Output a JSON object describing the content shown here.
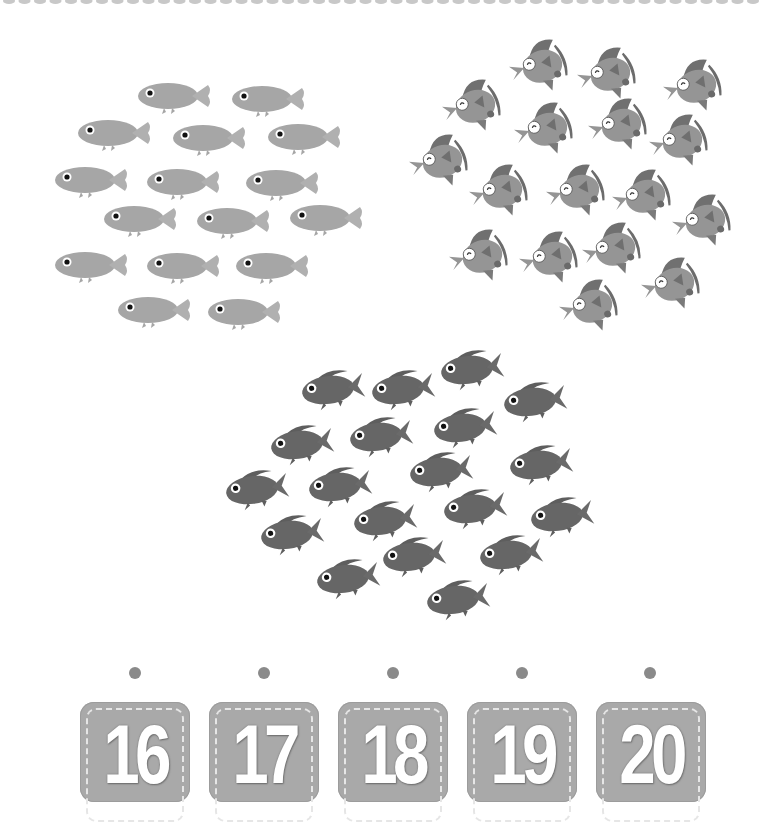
{
  "worksheet": {
    "task": "count-and-match",
    "groups": [
      {
        "name": "light-fish-group",
        "species": "plain fish",
        "count": 16,
        "color": "#a6a6a6",
        "positions": [
          [
            168,
            96
          ],
          [
            262,
            99
          ],
          [
            108,
            133
          ],
          [
            203,
            138
          ],
          [
            298,
            137
          ],
          [
            85,
            180
          ],
          [
            177,
            182
          ],
          [
            276,
            183
          ],
          [
            134,
            219
          ],
          [
            227,
            221
          ],
          [
            320,
            218
          ],
          [
            85,
            265
          ],
          [
            177,
            266
          ],
          [
            266,
            266
          ],
          [
            148,
            310
          ],
          [
            238,
            312
          ]
        ]
      },
      {
        "name": "angelfish-group",
        "species": "angelfish",
        "count": 17,
        "color": "#8f8f8f",
        "positions": [
          [
            540,
            65
          ],
          [
            608,
            73
          ],
          [
            694,
            85
          ],
          [
            473,
            105
          ],
          [
            545,
            128
          ],
          [
            619,
            124
          ],
          [
            680,
            140
          ],
          [
            440,
            160
          ],
          [
            500,
            190
          ],
          [
            577,
            190
          ],
          [
            643,
            195
          ],
          [
            703,
            220
          ],
          [
            480,
            255
          ],
          [
            550,
            257
          ],
          [
            613,
            248
          ],
          [
            672,
            283
          ],
          [
            590,
            305
          ]
        ]
      },
      {
        "name": "dark-fish-group",
        "species": "spiky fish",
        "count": 19,
        "color": "#666666",
        "positions": [
          [
            328,
            390
          ],
          [
            398,
            390
          ],
          [
            467,
            370
          ],
          [
            530,
            402
          ],
          [
            297,
            445
          ],
          [
            376,
            437
          ],
          [
            460,
            428
          ],
          [
            536,
            465
          ],
          [
            252,
            490
          ],
          [
            335,
            487
          ],
          [
            436,
            472
          ],
          [
            470,
            509
          ],
          [
            557,
            517
          ],
          [
            287,
            535
          ],
          [
            380,
            521
          ],
          [
            409,
            557
          ],
          [
            506,
            555
          ],
          [
            343,
            579
          ],
          [
            453,
            600
          ]
        ]
      }
    ],
    "answer_options": [
      {
        "label": "16",
        "dot_x": 135,
        "box_x": 80
      },
      {
        "label": "17",
        "dot_x": 264,
        "box_x": 209
      },
      {
        "label": "18",
        "dot_x": 393,
        "box_x": 338
      },
      {
        "label": "19",
        "dot_x": 522,
        "box_x": 467
      },
      {
        "label": "20",
        "dot_x": 650,
        "box_x": 596
      }
    ],
    "colors": {
      "dash_border": "#c8c8c8",
      "dot": "#8a8a8a",
      "number_box": "#a9a9a9",
      "number_text": "#ffffff"
    }
  }
}
